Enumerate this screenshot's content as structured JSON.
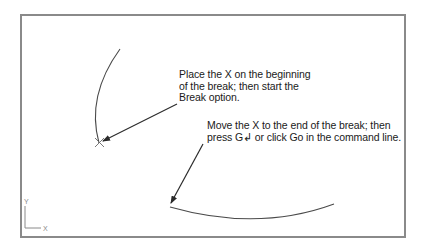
{
  "callouts": [
    {
      "id": "break-start",
      "lines": [
        "Place the X on the beginning",
        "of the break; then start the",
        "Break option."
      ]
    },
    {
      "id": "break-end",
      "lines": [
        "Move the X to the end of the break; then",
        "press G↲ or click Go in the command line."
      ]
    }
  ],
  "ucs_icon": {
    "y_label": "Y",
    "x_label": "X"
  },
  "colors": {
    "frame": "#8a8a8a",
    "geometry": "#4a4a4a",
    "arrow": "#2a2a2a",
    "text": "#1a1a1a"
  }
}
